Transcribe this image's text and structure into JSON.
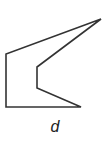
{
  "figure": {
    "label": "d",
    "shape": "concave hexagon (arrowhead-like polygon)",
    "vertices": [
      [
        101,
        19
      ],
      [
        6,
        54
      ],
      [
        6,
        107
      ],
      [
        81,
        107
      ],
      [
        37,
        88
      ],
      [
        37,
        67
      ]
    ],
    "stroke_color": "#333333"
  }
}
